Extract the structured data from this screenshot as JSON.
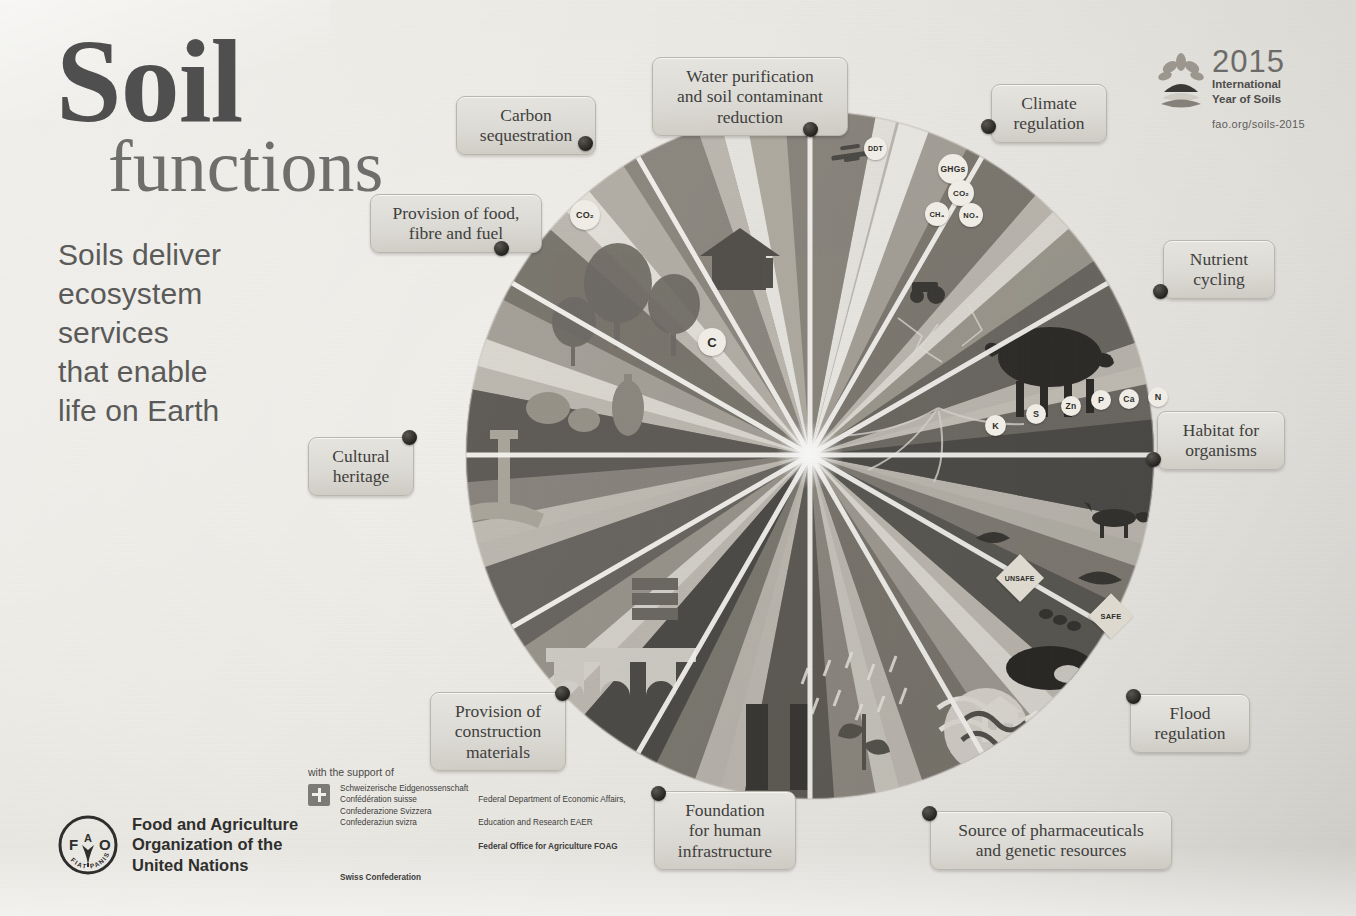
{
  "poster": {
    "title_main": "Soil",
    "title_sub": "functions",
    "tagline": "Soils deliver\necosystem\nservices\nthat enable\nlife on Earth",
    "background_color": "#e9e7e2",
    "label_text_color": "#3f3f3e",
    "dot_color": "#25231f"
  },
  "iys_logo": {
    "mark_name": "soil-sprout-icon",
    "year": "2015",
    "line1": "International",
    "line2": "Year of Soils",
    "url": "fao.org/soils-2015"
  },
  "callouts": [
    {
      "id": "carbon-sequestration",
      "label": "Carbon\nsequestration",
      "left": 456,
      "top": 96,
      "width": 140,
      "dot_left": 578,
      "dot_top": 136
    },
    {
      "id": "water-purification",
      "label": "Water purification\nand soil contaminant\nreduction",
      "left": 652,
      "top": 57,
      "width": 196,
      "dot_left": 803,
      "dot_top": 122
    },
    {
      "id": "climate-regulation",
      "label": "Climate\nregulation",
      "left": 991,
      "top": 84,
      "width": 116,
      "dot_left": 981,
      "dot_top": 119
    },
    {
      "id": "provision-food-fibre-fuel",
      "label": "Provision of food,\nfibre and fuel",
      "left": 370,
      "top": 194,
      "width": 172,
      "dot_left": 494,
      "dot_top": 241
    },
    {
      "id": "nutrient-cycling",
      "label": "Nutrient\ncycling",
      "left": 1163,
      "top": 240,
      "width": 112,
      "dot_left": 1153,
      "dot_top": 284
    },
    {
      "id": "cultural-heritage",
      "label": "Cultural\nheritage",
      "left": 308,
      "top": 437,
      "width": 106,
      "dot_left": 402,
      "dot_top": 430
    },
    {
      "id": "habitat-for-organisms",
      "label": "Habitat for\norganisms",
      "left": 1157,
      "top": 411,
      "width": 128,
      "dot_left": 1146,
      "dot_top": 452
    },
    {
      "id": "provision-construction",
      "label": "Provision of\nconstruction\nmaterials",
      "left": 430,
      "top": 692,
      "width": 136,
      "dot_left": 555,
      "dot_top": 686
    },
    {
      "id": "flood-regulation",
      "label": "Flood\nregulation",
      "left": 1130,
      "top": 694,
      "width": 120,
      "dot_left": 1126,
      "dot_top": 689
    },
    {
      "id": "foundation-infrastructure",
      "label": "Foundation\nfor human\ninfrastructure",
      "left": 654,
      "top": 791,
      "width": 142,
      "dot_left": 651,
      "dot_top": 786
    },
    {
      "id": "source-pharmaceuticals",
      "label": "Source of pharmaceuticals\nand genetic resources",
      "left": 930,
      "top": 811,
      "width": 242,
      "dot_left": 922,
      "dot_top": 806
    }
  ],
  "illustration_chips": [
    {
      "id": "co2-cloud",
      "text": "CO₂",
      "shape": "round",
      "left": 570,
      "top": 200,
      "size": 30,
      "font": 9
    },
    {
      "id": "ddt-drop",
      "text": "DDT",
      "shape": "round",
      "left": 864,
      "top": 137,
      "size": 23,
      "font": 7
    },
    {
      "id": "ghg-bubble",
      "text": "GHGs",
      "shape": "round",
      "left": 938,
      "top": 154,
      "size": 30,
      "font": 8.5
    },
    {
      "id": "ghg-co2",
      "text": "CO₂",
      "shape": "round",
      "left": 948,
      "top": 180,
      "size": 26,
      "font": 8
    },
    {
      "id": "ghg-ch4",
      "text": "CH₄",
      "shape": "round",
      "left": 925,
      "top": 202,
      "size": 24,
      "font": 7.5
    },
    {
      "id": "ghg-no3",
      "text": "NO₃",
      "shape": "round",
      "left": 959,
      "top": 203,
      "size": 24,
      "font": 7.5
    },
    {
      "id": "carbon-ball",
      "text": "C",
      "shape": "round",
      "left": 698,
      "top": 328,
      "size": 28,
      "font": 13
    },
    {
      "id": "nutrient-k",
      "text": "K",
      "shape": "round",
      "left": 985,
      "top": 415,
      "size": 21,
      "font": 9
    },
    {
      "id": "nutrient-s",
      "text": "S",
      "shape": "round",
      "left": 1026,
      "top": 404,
      "size": 20,
      "font": 9
    },
    {
      "id": "nutrient-zn",
      "text": "Zn",
      "shape": "round",
      "left": 1061,
      "top": 396,
      "size": 20,
      "font": 8.5
    },
    {
      "id": "nutrient-p",
      "text": "P",
      "shape": "round",
      "left": 1091,
      "top": 390,
      "size": 20,
      "font": 9
    },
    {
      "id": "nutrient-ca",
      "text": "Ca",
      "shape": "round",
      "left": 1119,
      "top": 389,
      "size": 20,
      "font": 8.5
    },
    {
      "id": "nutrient-n",
      "text": "N",
      "shape": "round",
      "left": 1148,
      "top": 387,
      "size": 20,
      "font": 9
    },
    {
      "id": "unsafe-tag",
      "text": "UNSAFE",
      "shape": "diamond",
      "left": 1003,
      "top": 561,
      "size": 34,
      "font": 7
    },
    {
      "id": "safe-tag",
      "text": "SAFE",
      "shape": "diamond",
      "left": 1095,
      "top": 600,
      "size": 32,
      "font": 7.5
    }
  ],
  "footer": {
    "fao_logo_name": "fao-logo",
    "fao_motto": "FIAT PANIS",
    "fao_letters": "FAO",
    "fao_name": "Food and Agriculture\nOrganization of the\nUnited Nations",
    "support_lead": "with the support of",
    "swiss_langs": "Schweizerische Eidgenossenschaft\nConfédération suisse\nConfederazione Svizzera\nConfederaziun svizra",
    "swiss_confederation": "Swiss Confederation",
    "federal_line1": "Federal Department of Economic Affairs,",
    "federal_line2": "Education and Research EAER",
    "federal_line3": "Federal Office for Agriculture FOAG"
  },
  "chart_data": {
    "type": "pie",
    "title": "Soil functions",
    "note": "Twelve equal radial segments of a soil-ecosystem-services wheel; each segment is an illustrated landscape cross-section labelled by one soil function.",
    "center": [
      810,
      455
    ],
    "radius": 430,
    "segment_count": 12,
    "values": [
      1,
      1,
      1,
      1,
      1,
      1,
      1,
      1,
      1,
      1,
      1,
      1
    ],
    "categories": [
      "Water purification and soil contaminant reduction",
      "Climate regulation",
      "Nutrient cycling",
      "Habitat for organisms",
      "Flood regulation",
      "Source of pharmaceuticals and genetic resources",
      "Foundation for human infrastructure",
      "Provision of construction materials",
      "Cultural heritage",
      "Provision of food, fibre and fuel",
      "Carbon sequestration",
      "Soil biodiversity and landscape"
    ],
    "legend_position": "around-perimeter",
    "grid": false
  }
}
